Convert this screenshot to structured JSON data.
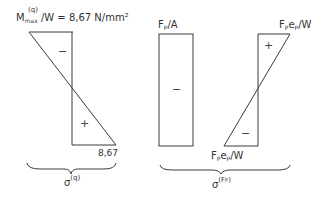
{
  "diagram": {
    "left": {
      "top_label_main": "M",
      "top_label_sup": "(q)",
      "top_label_sub": "max",
      "top_label_rest": "/W = 8,67 N/mm²",
      "upper_sign": "−",
      "lower_sign": "+",
      "bottom_value": "8,67",
      "brace_label_main": "σ",
      "brace_label_sup": "(q)"
    },
    "middle": {
      "top_label_main": "F",
      "top_label_sub": "P",
      "top_label_rest": "/A",
      "sign": "−"
    },
    "right": {
      "top_label_F": "F",
      "top_label_sub1": "P",
      "top_label_e": "e",
      "top_label_sub2": "P",
      "top_label_rest": "/W",
      "upper_sign": "+",
      "lower_sign": "−",
      "bottom_label_F": "F",
      "bottom_label_sub1": "P",
      "bottom_label_e": "e",
      "bottom_label_sub2": "P",
      "bottom_label_rest": "/W"
    },
    "right_brace_label": {
      "main": "σ",
      "sup": "(F",
      "sup_sub": "P",
      "sup_end": ")"
    },
    "line_color": "#333333"
  }
}
